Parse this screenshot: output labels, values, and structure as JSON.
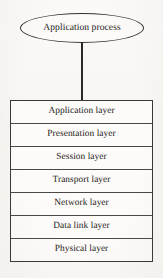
{
  "diagram": {
    "background_color": "#f8f7f4",
    "stroke_color": "#35332f",
    "text_color": "#1c1a18"
  },
  "process_node": {
    "shape": "ellipse",
    "label": "Application process"
  },
  "connector": {
    "orientation": "vertical",
    "from": "process_node",
    "to": "layer_stack"
  },
  "layer_stack": {
    "layers": [
      {
        "index": 7,
        "label": "Application layer"
      },
      {
        "index": 6,
        "label": "Presentation layer"
      },
      {
        "index": 5,
        "label": "Session layer"
      },
      {
        "index": 4,
        "label": "Transport layer"
      },
      {
        "index": 3,
        "label": "Network layer"
      },
      {
        "index": 2,
        "label": "Data link layer"
      },
      {
        "index": 1,
        "label": "Physical layer"
      }
    ]
  }
}
